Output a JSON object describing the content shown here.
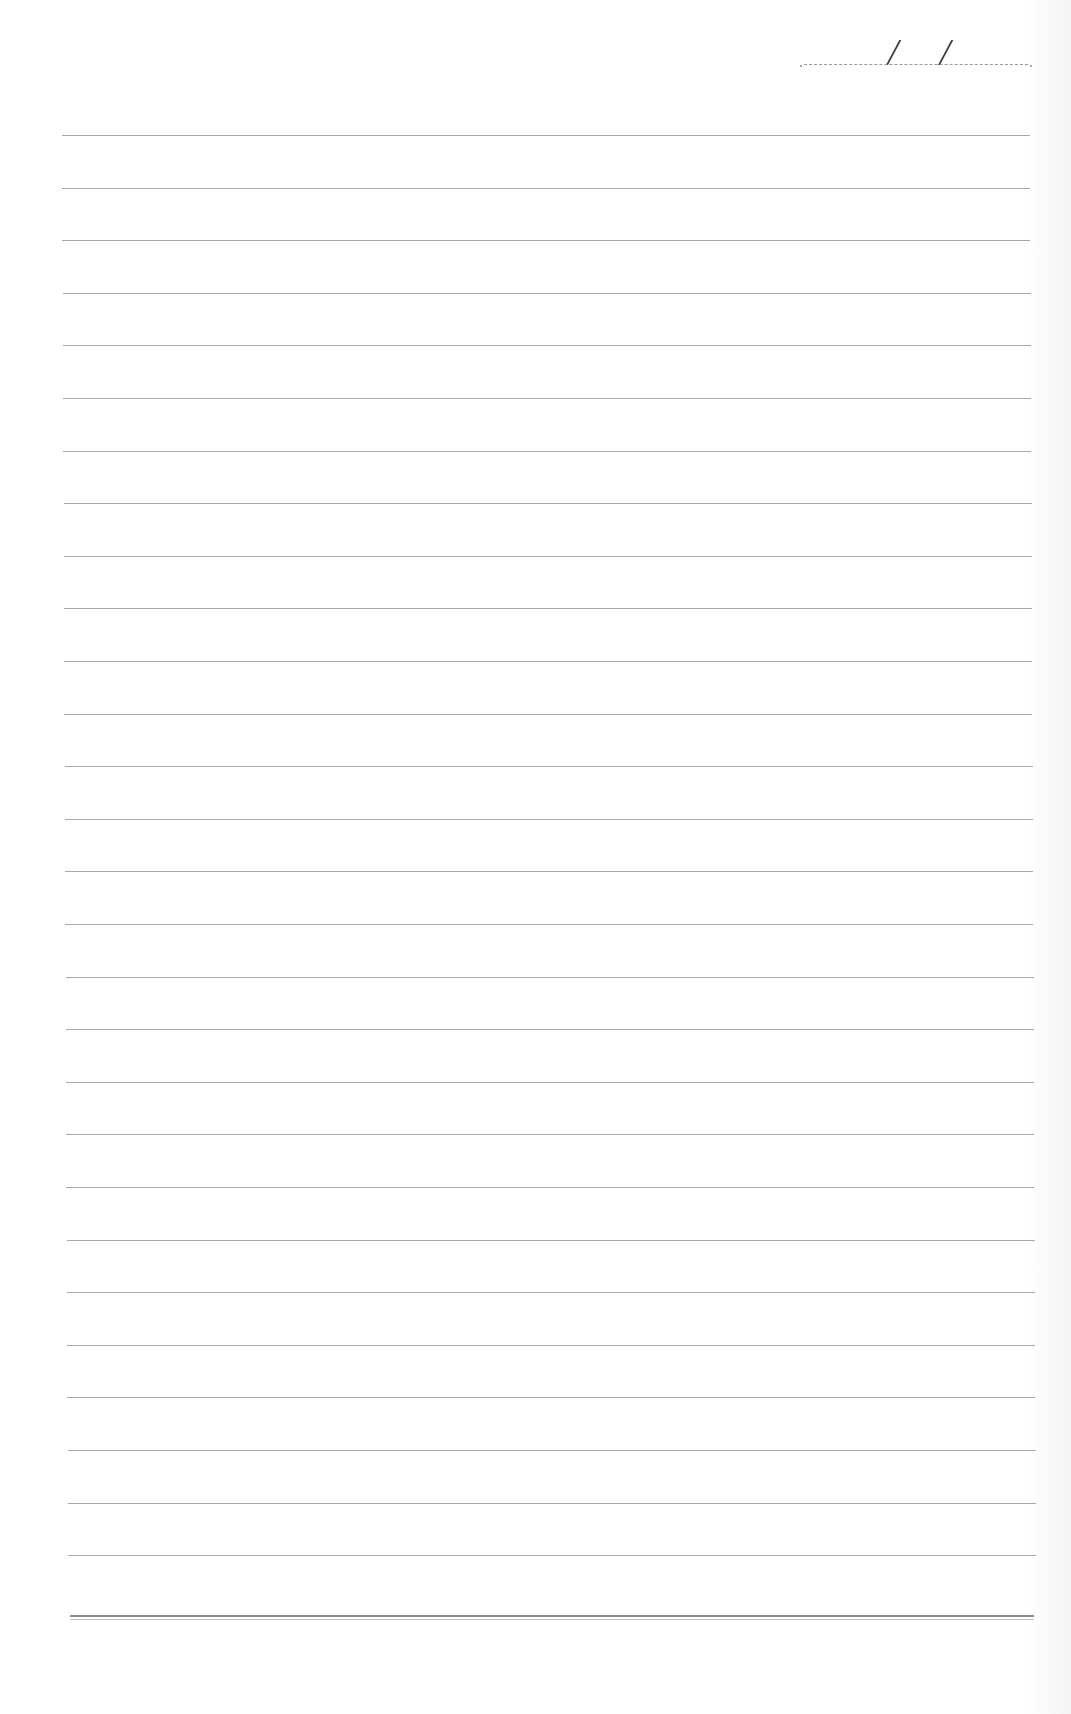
{
  "page": {
    "type": "lined-notebook-sheet",
    "background_color": "#ffffff",
    "line_color": "#a8a8a8",
    "bottom_line_color": "#8c8c8c"
  },
  "date_field": {
    "separator": "/",
    "day": "",
    "month": "",
    "year": ""
  },
  "ruled_lines": {
    "count": 28,
    "first_y": 135,
    "spacing": 52.6,
    "left": 64,
    "width": 968,
    "lines": [
      "",
      "",
      "",
      "",
      "",
      "",
      "",
      "",
      "",
      "",
      "",
      "",
      "",
      "",
      "",
      "",
      "",
      "",
      "",
      "",
      "",
      "",
      "",
      "",
      "",
      "",
      "",
      ""
    ]
  },
  "bottom_rule": {
    "y": 1615,
    "style": "double"
  }
}
